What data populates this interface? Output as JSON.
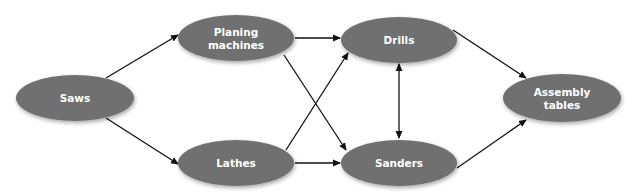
{
  "diagram": {
    "type": "flow-network",
    "colors": {
      "node_fill": "#6f6f6f",
      "node_text": "#ffffff",
      "edge": "#111111",
      "background": "#ffffff"
    },
    "nodes": [
      {
        "id": "saws",
        "label_lines": [
          "Saws"
        ],
        "cx": 75,
        "cy": 98,
        "rx": 59,
        "ry": 23
      },
      {
        "id": "planing",
        "label_lines": [
          "Planing",
          "machines"
        ],
        "cx": 236,
        "cy": 38,
        "rx": 58,
        "ry": 23
      },
      {
        "id": "lathes",
        "label_lines": [
          "Lathes"
        ],
        "cx": 236,
        "cy": 163,
        "rx": 58,
        "ry": 23
      },
      {
        "id": "drills",
        "label_lines": [
          "Drills"
        ],
        "cx": 399,
        "cy": 40,
        "rx": 58,
        "ry": 23
      },
      {
        "id": "sanders",
        "label_lines": [
          "Sanders"
        ],
        "cx": 399,
        "cy": 163,
        "rx": 58,
        "ry": 23
      },
      {
        "id": "assembly",
        "label_lines": [
          "Assembly",
          "tables"
        ],
        "cx": 562,
        "cy": 98,
        "rx": 59,
        "ry": 24
      }
    ],
    "edges": [
      {
        "from": "saws",
        "to": "planing",
        "x1": 106,
        "y1": 78,
        "x2": 178,
        "y2": 35,
        "bidirectional": false
      },
      {
        "from": "saws",
        "to": "lathes",
        "x1": 106,
        "y1": 118,
        "x2": 178,
        "y2": 164,
        "bidirectional": false
      },
      {
        "from": "planing",
        "to": "drills",
        "x1": 295,
        "y1": 38,
        "x2": 340,
        "y2": 38,
        "bidirectional": false
      },
      {
        "from": "planing",
        "to": "sanders",
        "x1": 284,
        "y1": 55,
        "x2": 346,
        "y2": 150,
        "bidirectional": false
      },
      {
        "from": "lathes",
        "to": "drills",
        "x1": 286,
        "y1": 150,
        "x2": 348,
        "y2": 53,
        "bidirectional": false
      },
      {
        "from": "lathes",
        "to": "sanders",
        "x1": 295,
        "y1": 163,
        "x2": 340,
        "y2": 163,
        "bidirectional": false
      },
      {
        "from": "drills",
        "to": "sanders",
        "x1": 399,
        "y1": 64,
        "x2": 399,
        "y2": 138,
        "bidirectional": true
      },
      {
        "from": "drills",
        "to": "assembly",
        "x1": 453,
        "y1": 30,
        "x2": 526,
        "y2": 78,
        "bidirectional": false
      },
      {
        "from": "sanders",
        "to": "assembly",
        "x1": 457,
        "y1": 168,
        "x2": 526,
        "y2": 120,
        "bidirectional": false
      }
    ]
  }
}
